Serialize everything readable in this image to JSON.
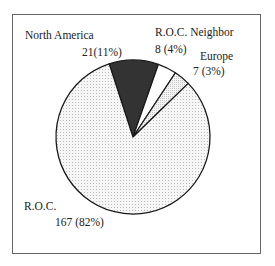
{
  "chart_data": {
    "type": "pie",
    "title": "",
    "slices": [
      {
        "label": "North America",
        "value": 21,
        "percent": 11,
        "display": "21(11%)",
        "fill": "#333333",
        "pattern": "solid"
      },
      {
        "label": "R.O.C. Neighbor",
        "value": 8,
        "percent": 4,
        "display": "8 (4%)",
        "fill": "#ffffff",
        "pattern": "none"
      },
      {
        "label": "Europe",
        "value": 7,
        "percent": 3,
        "display": "7 (3%)",
        "fill": "#eeeeee",
        "pattern": "dots-light"
      },
      {
        "label": "R.O.C.",
        "value": 167,
        "percent": 82,
        "display": "167 (82%)",
        "fill": "#f2f2f2",
        "pattern": "dots"
      }
    ],
    "start_angle_deg": -18,
    "direction": "clockwise",
    "legend": "none",
    "labels": "outside"
  },
  "labels": {
    "north_america": {
      "name": "North America",
      "value": "21(11%)"
    },
    "roc_neighbor": {
      "name": "R.O.C. Neighbor",
      "value": "8 (4%)"
    },
    "europe": {
      "name": "Europe",
      "value": "7 (3%)"
    },
    "roc": {
      "name": "R.O.C.",
      "value": "167 (82%)"
    }
  }
}
